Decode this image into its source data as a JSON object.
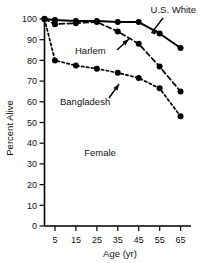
{
  "chart_data": {
    "type": "line",
    "title": "",
    "xlabel": "Age (yr)",
    "ylabel": "Percent Alive",
    "xlim": [
      0,
      70
    ],
    "ylim": [
      0,
      100
    ],
    "xticks": [
      5,
      15,
      25,
      35,
      45,
      55,
      65
    ],
    "yticks": [
      0,
      10,
      20,
      30,
      40,
      50,
      60,
      70,
      80,
      90,
      100
    ],
    "grid": false,
    "legend": "inline-annotations",
    "annotations": [
      {
        "text": "Female",
        "x": 27,
        "y": 30
      },
      {
        "text": "U.S. White",
        "x": 52,
        "y": 103,
        "points_to": "U.S. White"
      },
      {
        "text": "Harlem",
        "x": 22,
        "y": 85,
        "points_to": "Harlem"
      },
      {
        "text": "Bangladesh",
        "x": 25,
        "y": 67,
        "points_to": "Bangladesh"
      }
    ],
    "x": [
      0,
      5,
      15,
      25,
      35,
      45,
      55,
      65
    ],
    "series": [
      {
        "name": "U.S. White",
        "style": "solid",
        "values": [
          100,
          99.5,
          99,
          99,
          98.5,
          98.5,
          93,
          86
        ]
      },
      {
        "name": "Harlem",
        "style": "dashed",
        "values": [
          100,
          97.5,
          98,
          98.5,
          94,
          88,
          77,
          65
        ]
      },
      {
        "name": "Bangladesh",
        "style": "dotted",
        "values": [
          100,
          80,
          77.5,
          76,
          74,
          71.5,
          66.5,
          53
        ]
      }
    ]
  },
  "axis": {
    "y_title": "Percent Alive",
    "x_title": "Age (yr)",
    "y_tick_labels": [
      "100",
      "90",
      "80",
      "70",
      "60",
      "50",
      "40",
      "30",
      "20",
      "10",
      "0"
    ],
    "x_tick_labels": [
      "5",
      "15",
      "25",
      "35",
      "45",
      "55",
      "65"
    ]
  },
  "labels": {
    "us_white": "U.S. White",
    "harlem": "Harlem",
    "bangladesh": "Bangladesh",
    "female": "Female"
  }
}
